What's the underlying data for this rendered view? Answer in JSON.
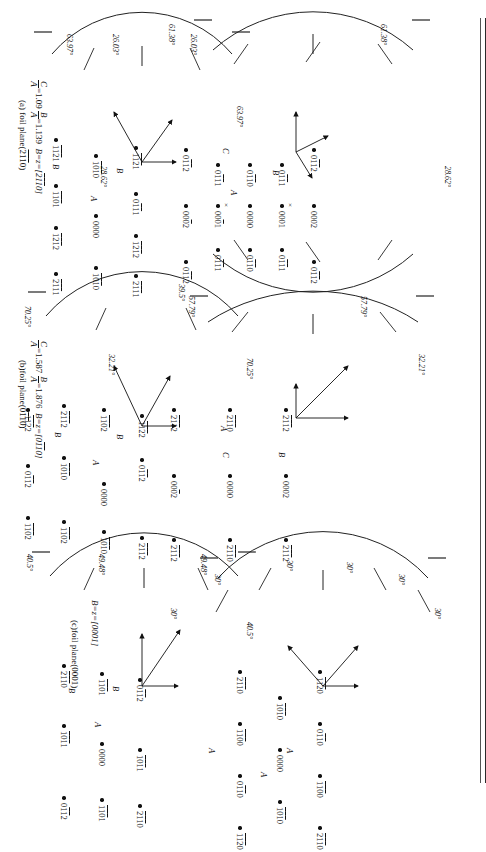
{
  "figure": {
    "panel_count": 6
  },
  "panels": [
    {
      "id": "a",
      "caption_line1": "C/A=1.09  B/A=1.139  B=z=[2̅1̅1̅0]",
      "ratio_c": "1.09",
      "ratio_b": "1.139",
      "zone": "B=z=[2̅1̅1̅0]",
      "caption_line2": "(a) foil plane(2̅1̅1̅0)",
      "angles": [
        "61.38°",
        "61.38°",
        "28.62°",
        "28.62°"
      ],
      "spots": [
        {
          "label": "01̅1̅2",
          "x": 40,
          "y": 24
        },
        {
          "label": "0002",
          "x": 96,
          "y": 24
        },
        {
          "label": "01̅1̅2",
          "x": 152,
          "y": 24
        },
        {
          "label": "01̅1̅1",
          "x": 55,
          "y": 56
        },
        {
          "label": "0001",
          "x": 96,
          "y": 56,
          "marker": "x"
        },
        {
          "label": "01̅1̅1",
          "x": 140,
          "y": 56
        },
        {
          "label": "01̅1̅0",
          "x": 55,
          "y": 88
        },
        {
          "label": "0000",
          "x": 96,
          "y": 88
        },
        {
          "label": "01̅1̅0",
          "x": 140,
          "y": 88
        },
        {
          "label": "01̅1̅1",
          "x": 55,
          "y": 120
        },
        {
          "label": "000̅1",
          "x": 96,
          "y": 120,
          "marker": "x"
        },
        {
          "label": "01̅1̅1",
          "x": 140,
          "y": 120
        },
        {
          "label": "01̅1̅2",
          "x": 40,
          "y": 152
        },
        {
          "label": "000̅2",
          "x": 96,
          "y": 152
        },
        {
          "label": "01̅1̅2",
          "x": 152,
          "y": 152
        }
      ],
      "vectors": [
        "A",
        "B",
        "C"
      ]
    },
    {
      "id": "b",
      "caption_line1": "C/A=1.587  B/A=1.876  B=z=[01̅1̅0]",
      "ratio_c": "1.587",
      "ratio_b": "1.876",
      "zone": "B=z=[01̅1̅0]",
      "caption_line2": "(b)foil plane(01̅1̅0)",
      "angles": [
        "57.79°",
        "57.79°",
        "32.21°",
        "32.21°"
      ],
      "spots": [
        {
          "label": "2̅1̅1̅2",
          "x": 30,
          "y": 22
        },
        {
          "label": "0002",
          "x": 96,
          "y": 22
        },
        {
          "label": "2̅1̅1̅2",
          "x": 160,
          "y": 22
        },
        {
          "label": "2̅1̅1̅0",
          "x": 30,
          "y": 78
        },
        {
          "label": "0000",
          "x": 96,
          "y": 78
        },
        {
          "label": "2̅1̅1̅0",
          "x": 160,
          "y": 78
        },
        {
          "label": "2̅1̅1̅2",
          "x": 30,
          "y": 134
        },
        {
          "label": "000̅2",
          "x": 96,
          "y": 134
        },
        {
          "label": "2̅1̅1̅2",
          "x": 160,
          "y": 134
        }
      ],
      "vectors": [
        "A",
        "B",
        "C"
      ]
    },
    {
      "id": "c",
      "caption_line1": "B=z=[0001]",
      "zone": "B=z=[0001]",
      "caption_line2": "(c)foil plane(0001)",
      "angles": [
        "30°",
        "30°",
        "30°",
        "30°",
        "30°",
        "30°"
      ],
      "spots": [
        {
          "label": "1̅1̅2̅0",
          "x": 26,
          "y": 18
        },
        {
          "label": "01̅1̅0",
          "x": 78,
          "y": 18
        },
        {
          "label": "1̅1̅0̅0",
          "x": 130,
          "y": 18
        },
        {
          "label": "2̅1̅1̅0",
          "x": 182,
          "y": 18
        },
        {
          "label": "1̅0̅1̅0",
          "x": 52,
          "y": 58
        },
        {
          "label": "0000",
          "x": 104,
          "y": 58
        },
        {
          "label": "1̅0̅1̅0",
          "x": 156,
          "y": 58
        },
        {
          "label": "2̅1̅1̅0",
          "x": 26,
          "y": 98
        },
        {
          "label": "1̅1̅0̅0",
          "x": 78,
          "y": 98
        },
        {
          "label": "01̅1̅0",
          "x": 130,
          "y": 98
        },
        {
          "label": "1̅1̅2̅0",
          "x": 182,
          "y": 98
        }
      ],
      "vectors": [
        "A",
        "A",
        "A"
      ]
    },
    {
      "id": "d",
      "caption_line1": "B/A=1.139  B=z=[1̅2̅1̅3]",
      "ratio_b": "1.139",
      "zone": "B=z=[1̅2̅1̅3]",
      "caption_line2": "(d)",
      "angles": [
        "26.03°",
        "26.03°",
        "63.97°",
        "63.97°"
      ],
      "spots": [
        {
          "label": "1̅1̅2̅1",
          "x": 32,
          "y": 16
        },
        {
          "label": "01̅1̅1",
          "x": 78,
          "y": 16
        },
        {
          "label": "1̅2̅1̅2",
          "x": 120,
          "y": 16
        },
        {
          "label": "2̅1̅1̅1",
          "x": 160,
          "y": 16
        },
        {
          "label": "1̅0̅1̅0",
          "x": 40,
          "y": 56
        },
        {
          "label": "0000",
          "x": 100,
          "y": 56
        },
        {
          "label": "1̅0̅1̅0",
          "x": 152,
          "y": 56
        },
        {
          "label": "1̅1̅2̅1",
          "x": 24,
          "y": 96
        },
        {
          "label": "1̅1̅0̅1",
          "x": 70,
          "y": 96
        },
        {
          "label": "1̅2̅1̅2",
          "x": 112,
          "y": 96
        },
        {
          "label": "2̅1̅1̅1",
          "x": 158,
          "y": 96
        }
      ],
      "vectors": [
        "A",
        "B",
        "B"
      ]
    },
    {
      "id": "e",
      "caption_line1": "B/A=1.480  B=z=[2̅4̅2̅3]",
      "ratio_b": "1.480",
      "zone": "B=z=[2̅4̅2̅3]",
      "caption_line2": "(e)",
      "angles": [
        "39.5°",
        "70.25°",
        "70.25°"
      ],
      "spots": [
        {
          "label": "1̅1̅2̅2",
          "x": 36,
          "y": 14
        },
        {
          "label": "01̅1̅2",
          "x": 80,
          "y": 14
        },
        {
          "label": "2̅1̅1̅2",
          "x": 158,
          "y": 14
        },
        {
          "label": "1̅1̅0̅2",
          "x": 30,
          "y": 52
        },
        {
          "label": "0000",
          "x": 104,
          "y": 52
        },
        {
          "label": "1̅0̅1̅0",
          "x": 152,
          "y": 52
        },
        {
          "label": "2̅1̅1̅2",
          "x": 26,
          "y": 92
        },
        {
          "label": "1̅0̅1̅0",
          "x": 78,
          "y": 92
        },
        {
          "label": "1̅1̅0̅2",
          "x": 142,
          "y": 92
        },
        {
          "label": "1̅1̅2̅2",
          "x": 30,
          "y": 128
        },
        {
          "label": "01̅1̅2",
          "x": 86,
          "y": 128
        },
        {
          "label": "1̅1̅0̅2",
          "x": 138,
          "y": 128
        }
      ],
      "vectors": [
        "A",
        "B",
        "B"
      ]
    },
    {
      "id": "f",
      "caption_line1": "B/A=1.299  B=z=[01̅1̅1]",
      "ratio_b": "1.299",
      "zone": "B=z=[01̅1̅1]",
      "caption_line2": "(f)",
      "angles": [
        "49.48°",
        "49.48°",
        "40.5°",
        "40.5°"
      ],
      "spots": [
        {
          "label": "01̅1̅2",
          "x": 40,
          "y": 16
        },
        {
          "label": "1̅0̅1̅1",
          "x": 110,
          "y": 16
        },
        {
          "label": "2̅1̅1̅0",
          "x": 166,
          "y": 16
        },
        {
          "label": "1̅1̅0̅1",
          "x": 34,
          "y": 54
        },
        {
          "label": "0000",
          "x": 104,
          "y": 54
        },
        {
          "label": "1̅1̅0̅1",
          "x": 160,
          "y": 54
        },
        {
          "label": "2̅1̅1̅0",
          "x": 26,
          "y": 92
        },
        {
          "label": "1̅0̅1̅1",
          "x": 86,
          "y": 92
        },
        {
          "label": "01̅1̅2",
          "x": 158,
          "y": 92
        }
      ],
      "vectors": [
        "A",
        "B"
      ]
    }
  ],
  "symbols": {
    "vector_a": "A",
    "vector_b": "B",
    "vector_c": "C",
    "x_marker": "×"
  },
  "chart_data": {
    "type": "scatter",
    "panels": [
      "(a) foil plane(2̅1̅1̅0)",
      "(b)foil plane(01̅1̅0)",
      "(c)foil plane(0001)",
      "(d)",
      "(e)",
      "(f)"
    ],
    "legend": [
      "A",
      "B",
      "C"
    ],
    "grid": false,
    "xlabel": "",
    "ylabel": ""
  }
}
